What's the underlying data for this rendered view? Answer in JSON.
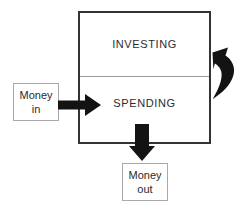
{
  "diagram": {
    "main_box": {
      "name": "money-container",
      "sections": [
        {
          "id": "investing",
          "label": "INVESTING"
        },
        {
          "id": "spending",
          "label": "SPENDING"
        }
      ]
    },
    "nodes": [
      {
        "id": "money-in",
        "line1": "Money",
        "line2": "in"
      },
      {
        "id": "money-out",
        "line1": "Money",
        "line2": "out"
      }
    ],
    "arrows": [
      {
        "id": "arrow-money-in",
        "icon": "arrow-right-icon",
        "direction": "right"
      },
      {
        "id": "arrow-money-out",
        "icon": "arrow-down-icon",
        "direction": "down"
      },
      {
        "id": "arrow-investing-return",
        "icon": "curved-arrow-down-icon",
        "direction": "curved-down"
      }
    ],
    "colors": {
      "box_border": "#333333",
      "divider": "#9a9a9a",
      "small_box_border": "#aaaaaa",
      "arrow": "#131313",
      "text": "#2b2b2b",
      "background": "#ffffff"
    }
  }
}
